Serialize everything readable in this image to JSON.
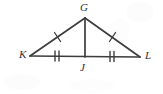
{
  "figure": {
    "background_color": "#ffffff",
    "line_color": "#3d3d3d",
    "label_color": "#2f2f2f",
    "tick_color": "#3d3d3d",
    "labels": {
      "apex": "G",
      "left_vertex": "K",
      "base_midpoint": "J",
      "right_vertex": "L"
    },
    "points": {
      "G": {
        "x": 85,
        "y": 18
      },
      "K": {
        "x": 30,
        "y": 56
      },
      "J": {
        "x": 85,
        "y": 57
      },
      "L": {
        "x": 140,
        "y": 57
      }
    },
    "segments": [
      {
        "name": "KG",
        "from": "K",
        "to": "G",
        "ticks": 1
      },
      {
        "name": "GL",
        "from": "G",
        "to": "L",
        "ticks": 1
      },
      {
        "name": "KJ",
        "from": "K",
        "to": "J",
        "ticks": 2
      },
      {
        "name": "JL",
        "from": "J",
        "to": "L",
        "ticks": 2
      },
      {
        "name": "GJ",
        "from": "G",
        "to": "J",
        "ticks": 0
      }
    ]
  }
}
